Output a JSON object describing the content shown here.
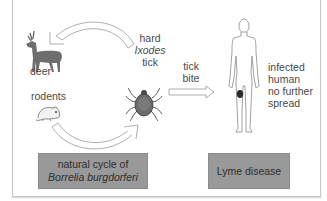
{
  "diagram": {
    "labels": {
      "deer": "deer",
      "rodents": "rodents",
      "tick": [
        "hard",
        "Ixodes",
        "tick"
      ],
      "tick_bite": [
        "tick",
        "bite"
      ],
      "infected_human": [
        "infected",
        "human",
        "no further",
        "spread"
      ]
    },
    "boxes": {
      "natural_cycle": [
        "natural cycle of",
        "Borrelia burgdorferi"
      ],
      "lyme_disease": "Lyme disease"
    },
    "colors": {
      "box_fill": "#999999",
      "animal_fill": "#6e6e6e",
      "frame_border": "#c9c9c9",
      "arrow_outline": "#9a9a9a",
      "rash": "#2a2a2a"
    },
    "icons": [
      "deer-icon",
      "rodent-icon",
      "tick-icon",
      "human-figure-icon",
      "cycle-arrow-top-icon",
      "cycle-arrow-bottom-icon",
      "tick-bite-arrow-icon"
    ]
  }
}
